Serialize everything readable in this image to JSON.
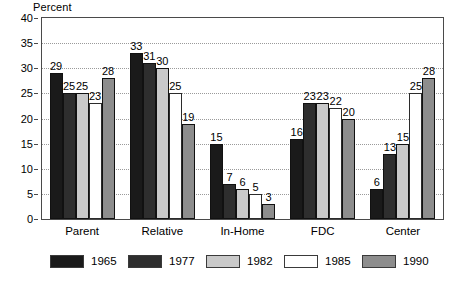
{
  "chart_data": {
    "type": "bar",
    "title": "",
    "xlabel": "",
    "ylabel": "Percent",
    "ylim": [
      0,
      40
    ],
    "ytick_step": 5,
    "yticks": [
      "0",
      "5",
      "10",
      "15",
      "20",
      "25",
      "30",
      "35",
      "40"
    ],
    "grid": true,
    "legend_position": "bottom",
    "categories": [
      "Parent",
      "Relative",
      "In-Home",
      "FDC",
      "Center"
    ],
    "series": [
      {
        "name": "1965",
        "color": "#1a1a1a",
        "values": [
          29,
          33,
          15,
          16,
          6
        ]
      },
      {
        "name": "1977",
        "color": "#2e2e2e",
        "values": [
          25,
          31,
          7,
          23,
          13
        ]
      },
      {
        "name": "1982",
        "color": "#c9c9c9",
        "values": [
          25,
          30,
          6,
          23,
          15
        ]
      },
      {
        "name": "1985",
        "color": "#ffffff",
        "values": [
          23,
          25,
          5,
          22,
          25
        ]
      },
      {
        "name": "1990",
        "color": "#8d8d8d",
        "values": [
          28,
          19,
          3,
          20,
          28
        ]
      }
    ]
  },
  "axis": {
    "y_title": "Percent"
  },
  "colors": {
    "frame": "#4a4a4a",
    "gridline": "#9a9a9a",
    "text": "#000000",
    "background": "#ffffff"
  }
}
